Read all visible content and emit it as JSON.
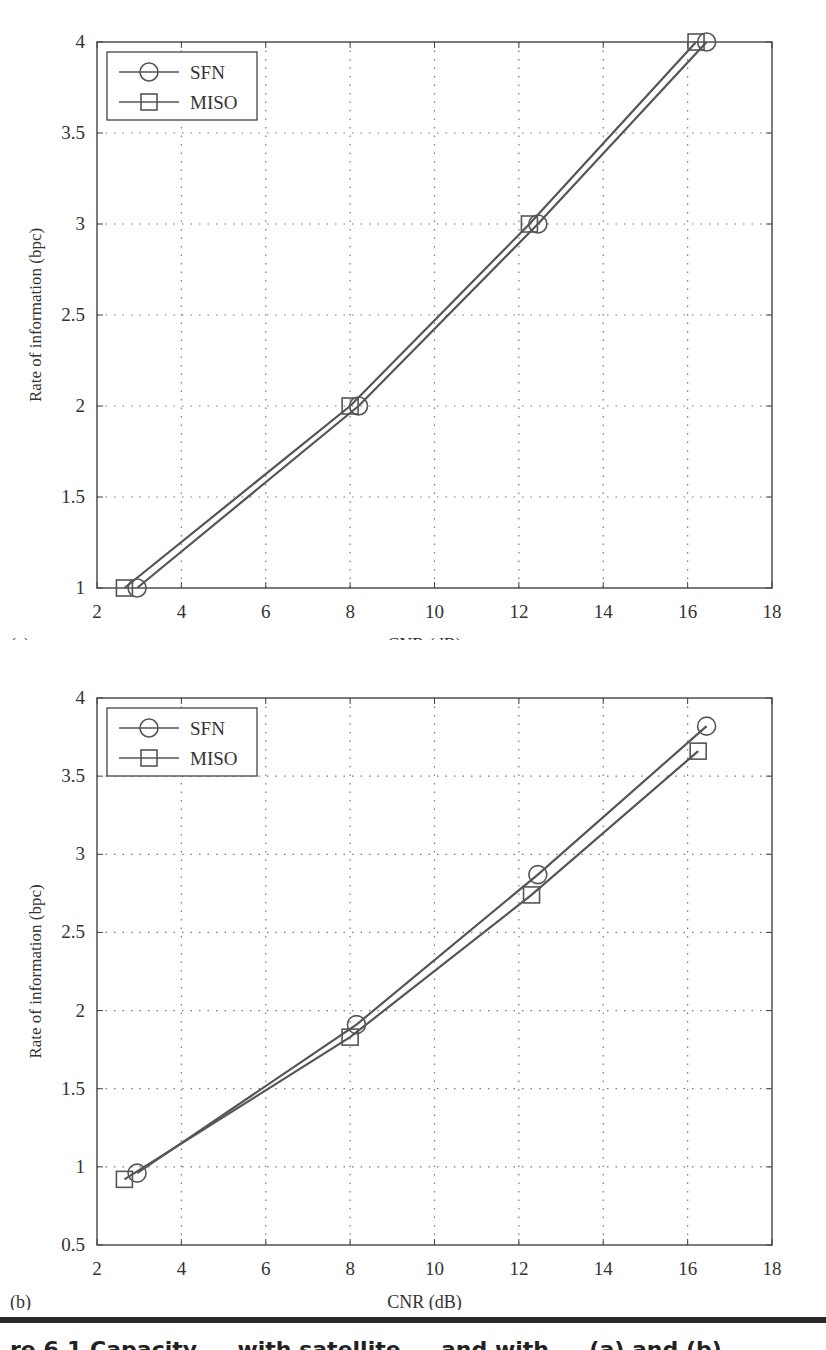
{
  "figure": {
    "caption_fragment": "re 6.1   Capacity ... with satellite ... and with ... (a) and (b)",
    "colors": {
      "line": "#555555",
      "grid": "#777777",
      "axis": "#444444",
      "text": "#333333"
    }
  },
  "chart_data": [
    {
      "panel_label": "(a)",
      "type": "line",
      "title": "",
      "xlabel": "CNR (dB)",
      "ylabel": "Rate of information (bpc)",
      "xlim": [
        2,
        18
      ],
      "ylim": [
        1,
        4
      ],
      "xticks": [
        2,
        4,
        6,
        8,
        10,
        12,
        14,
        16,
        18
      ],
      "yticks": [
        1,
        1.5,
        2,
        2.5,
        3,
        3.5,
        4
      ],
      "xtick_labels": [
        "2",
        "4",
        "6",
        "8",
        "10",
        "12",
        "14",
        "16",
        "18"
      ],
      "ytick_labels": [
        "1",
        "1.5",
        "2",
        "2.5",
        "3",
        "3.5",
        "4"
      ],
      "grid": true,
      "legend_position": "upper left",
      "series": [
        {
          "name": "SFN",
          "marker": "circle",
          "x": [
            2.95,
            8.2,
            12.45,
            16.45
          ],
          "y": [
            1.0,
            2.0,
            3.0,
            4.0
          ]
        },
        {
          "name": "MISO",
          "marker": "square",
          "x": [
            2.65,
            8.0,
            12.25,
            16.2
          ],
          "y": [
            1.0,
            2.0,
            3.0,
            4.0
          ]
        }
      ]
    },
    {
      "panel_label": "(b)",
      "type": "line",
      "title": "",
      "xlabel": "CNR (dB)",
      "ylabel": "Rate of information (bpc)",
      "xlim": [
        2,
        18
      ],
      "ylim": [
        0.5,
        4
      ],
      "xticks": [
        2,
        4,
        6,
        8,
        10,
        12,
        14,
        16,
        18
      ],
      "yticks": [
        0.5,
        1,
        1.5,
        2,
        2.5,
        3,
        3.5,
        4
      ],
      "xtick_labels": [
        "2",
        "4",
        "6",
        "8",
        "10",
        "12",
        "14",
        "16",
        "18"
      ],
      "ytick_labels": [
        "0.5",
        "1",
        "1.5",
        "2",
        "2.5",
        "3",
        "3.5",
        "4"
      ],
      "grid": true,
      "legend_position": "upper left",
      "series": [
        {
          "name": "SFN",
          "marker": "circle",
          "x": [
            2.95,
            8.15,
            12.45,
            16.45
          ],
          "y": [
            0.96,
            1.91,
            2.87,
            3.82
          ]
        },
        {
          "name": "MISO",
          "marker": "square",
          "x": [
            2.65,
            8.0,
            12.3,
            16.25
          ],
          "y": [
            0.92,
            1.83,
            2.74,
            3.66
          ]
        }
      ]
    }
  ]
}
